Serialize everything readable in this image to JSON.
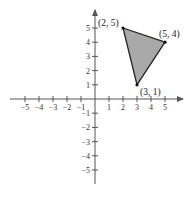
{
  "diagram": {
    "type": "coordinate-plane",
    "x_range": [
      -5,
      5
    ],
    "y_range": [
      -5,
      5
    ],
    "x_ticks": [
      "-5",
      "-4",
      "-3",
      "-2",
      "-1",
      "1",
      "2",
      "3",
      "4",
      "5"
    ],
    "y_ticks": [
      "5",
      "4",
      "3",
      "2",
      "1",
      "-1",
      "-2",
      "-3",
      "-4",
      "-5"
    ],
    "polygon": {
      "shape": "triangle",
      "fill_color": "#a9a9a9",
      "stroke_color": "#222222",
      "vertices": [
        {
          "x": 2,
          "y": 5,
          "label": "(2, 5)"
        },
        {
          "x": 5,
          "y": 4,
          "label": "(5, 4)"
        },
        {
          "x": 3,
          "y": 1,
          "label": "(3, 1)"
        }
      ]
    }
  }
}
